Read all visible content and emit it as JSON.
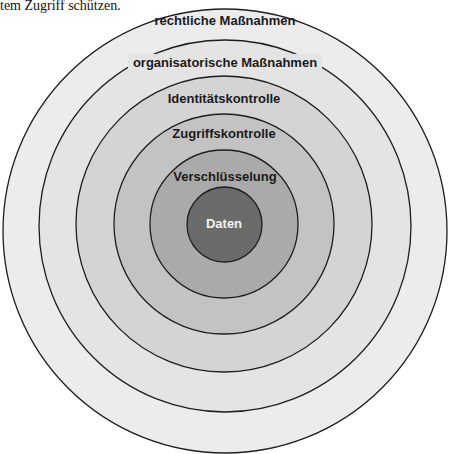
{
  "caption": {
    "text": "tem Zugriff schützen."
  },
  "diagram": {
    "type": "concentric-layers",
    "center": {
      "x": 225,
      "y": 224
    },
    "layers": [
      {
        "id": "rechtliche",
        "label": "rechtliche Maßnahmen",
        "radius": 222,
        "fill": "#ececec",
        "label_y": 25
      },
      {
        "id": "organisatorische",
        "label": "organisatorische Maßnahmen",
        "radius": 185,
        "fill": "#e4e4e4",
        "label_y": 67
      },
      {
        "id": "identitaet",
        "label": "Identitätskontrolle",
        "radius": 148,
        "fill": "#d4d4d4",
        "label_y": 103
      },
      {
        "id": "zugriff",
        "label": "Zugriffskontrolle",
        "radius": 111,
        "fill": "#c3c3c3",
        "label_y": 138
      },
      {
        "id": "verschluesselung",
        "label": "Verschlüsselung",
        "radius": 74,
        "fill": "#aaaaaa",
        "label_y": 181
      },
      {
        "id": "daten",
        "label": "Daten",
        "radius": 37,
        "fill": "#6b6b6b",
        "label_y": 228
      }
    ],
    "stroke_color": "#1e1e1e"
  }
}
